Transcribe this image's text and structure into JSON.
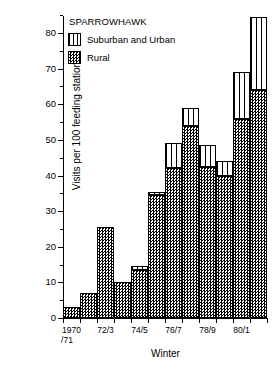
{
  "page_header_artifact": "",
  "chart_data": {
    "type": "bar",
    "subtype": "stacked-bar",
    "title": "SPARROWHAWK",
    "xlabel": "Winter",
    "ylabel": "Visits per 100 feeding stations",
    "ylim": [
      0,
      85
    ],
    "ytick_major_step": 10,
    "ytick_minor_step": 5,
    "yticks": [
      0,
      10,
      20,
      30,
      40,
      50,
      60,
      70,
      80
    ],
    "ytick_labels": [
      "0",
      "10",
      "20",
      "30",
      "40",
      "50",
      "60",
      "70",
      "80"
    ],
    "grid": false,
    "legend_position": "top-left",
    "categories": [
      "1970/71",
      "71/2",
      "72/3",
      "73/4",
      "74/5",
      "75/6",
      "76/7",
      "77/8",
      "78/9",
      "79/80",
      "80/1",
      "81/2"
    ],
    "xtick_labels": [
      {
        "index": 0,
        "line1": "1970",
        "line2": "/71"
      },
      {
        "index": 2,
        "line1": "72/3",
        "line2": ""
      },
      {
        "index": 4,
        "line1": "74/5",
        "line2": ""
      },
      {
        "index": 6,
        "line1": "76/7",
        "line2": ""
      },
      {
        "index": 8,
        "line1": "78/9",
        "line2": ""
      },
      {
        "index": 10,
        "line1": "80/1",
        "line2": ""
      }
    ],
    "series": [
      {
        "name": "Rural",
        "pattern": "checkerboard-stipple",
        "values": [
          3,
          7,
          25.5,
          10,
          13.5,
          34.5,
          42,
          54,
          42.5,
          40,
          56,
          64
        ]
      },
      {
        "name": "Suburban and Urban",
        "pattern": "vertical-stripes",
        "values": [
          0,
          0,
          0,
          0,
          1,
          1,
          7,
          5,
          6,
          4,
          13,
          20.5
        ]
      }
    ],
    "totals": [
      3,
      7,
      25.5,
      10,
      14.5,
      35.5,
      49,
      59,
      48.5,
      44,
      69,
      84.5
    ]
  },
  "legend": {
    "title": "SPARROWHAWK",
    "items": [
      {
        "label": "Suburban and Urban",
        "pattern": "vertical-stripes"
      },
      {
        "label": "Rural",
        "pattern": "checkerboard-stipple"
      }
    ]
  }
}
